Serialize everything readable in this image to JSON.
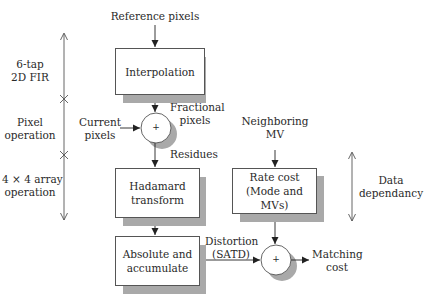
{
  "diagram": {
    "inputs": {
      "reference_pixels": "Reference pixels",
      "current_pixels_1": "Current",
      "current_pixels_2": "pixels",
      "neighboring_mv_1": "Neighboring",
      "neighboring_mv_2": "MV"
    },
    "blocks": {
      "interpolation": "Interpolation",
      "hadamard_1": "Hadamard",
      "hadamard_2": "transform",
      "absolute_1": "Absolute and",
      "absolute_2": "accumulate",
      "rate_1": "Rate cost",
      "rate_2": "(Mode and MVs)"
    },
    "adders": {
      "symbol": "+"
    },
    "edges": {
      "fractional_1": "Fractional",
      "fractional_2": "pixels",
      "residues": "Residues",
      "distortion_1": "Distortion",
      "distortion_2": "(SATD)",
      "matching_1": "Matching",
      "matching_2": "cost"
    },
    "left_axis": {
      "seg1_1": "6-tap",
      "seg1_2": "2D FIR",
      "seg2_1": "Pixel",
      "seg2_2": "operation",
      "seg3_1": "4 × 4 array",
      "seg3_2": "operation"
    },
    "right_axis": {
      "label_1": "Data",
      "label_2": "dependancy"
    }
  }
}
